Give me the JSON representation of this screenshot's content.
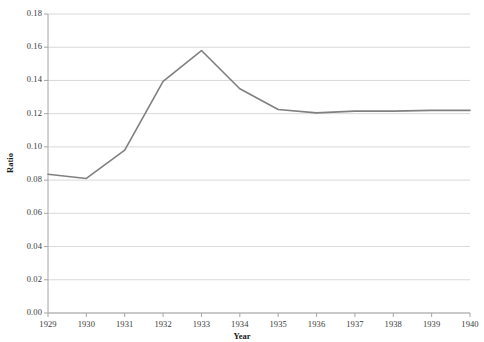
{
  "chart_data": {
    "type": "line",
    "title": "",
    "xlabel": "Year",
    "ylabel": "Ratio",
    "x": [
      1929,
      1930,
      1931,
      1932,
      1933,
      1934,
      1935,
      1936,
      1937,
      1938,
      1939,
      1940
    ],
    "categories": [
      "1929",
      "1930",
      "1931",
      "1932",
      "1933",
      "1934",
      "1935",
      "1936",
      "1937",
      "1938",
      "1939",
      "1940"
    ],
    "values": [
      0.0835,
      0.081,
      0.098,
      0.1395,
      0.158,
      0.135,
      0.1225,
      0.1205,
      0.1215,
      0.1215,
      0.122,
      0.122
    ],
    "series": [
      {
        "name": "Ratio",
        "values": [
          0.0835,
          0.081,
          0.098,
          0.1395,
          0.158,
          0.135,
          0.1225,
          0.1205,
          0.1215,
          0.1215,
          0.122,
          0.122
        ],
        "color": "#808080"
      }
    ],
    "ylim": [
      0.0,
      0.18
    ],
    "xlim": [
      1929,
      1940
    ],
    "yticks": [
      0.0,
      0.02,
      0.04,
      0.06,
      0.08,
      0.1,
      0.12,
      0.14,
      0.16,
      0.18
    ],
    "ytick_labels": [
      "0.00",
      "0.02",
      "0.04",
      "0.06",
      "0.08",
      "0.10",
      "0.12",
      "0.14",
      "0.16",
      "0.18"
    ],
    "xticks": [
      1929,
      1930,
      1931,
      1932,
      1933,
      1934,
      1935,
      1936,
      1937,
      1938,
      1939,
      1940
    ],
    "xtick_labels": [
      "1929",
      "1930",
      "1931",
      "1932",
      "1933",
      "1934",
      "1935",
      "1936",
      "1937",
      "1938",
      "1939",
      "1940"
    ],
    "grid": "horizontal",
    "grid_color": "#d9d9d9",
    "axis_color": "#a6a6a6",
    "legend": "none",
    "markers": "none",
    "line_width": 1.6,
    "background": "#ffffff"
  }
}
